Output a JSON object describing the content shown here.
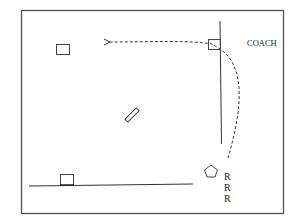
{
  "diagram": {
    "type": "baseball-play",
    "labels": {
      "coach": "COACH",
      "runners": [
        "R",
        "R",
        "R"
      ]
    },
    "elements": [
      {
        "name": "second-base",
        "shape": "square"
      },
      {
        "name": "first-base",
        "shape": "square"
      },
      {
        "name": "third-base",
        "shape": "square"
      },
      {
        "name": "home-plate",
        "shape": "pentagon"
      },
      {
        "name": "pitcher-rubber",
        "shape": "rectangle"
      },
      {
        "name": "throw-path",
        "style": "dashed-arrow",
        "from": "home-plate",
        "via": "first-base",
        "to": "second-base"
      }
    ],
    "colors": {
      "line": "#333333",
      "background": "#ffffff"
    }
  }
}
